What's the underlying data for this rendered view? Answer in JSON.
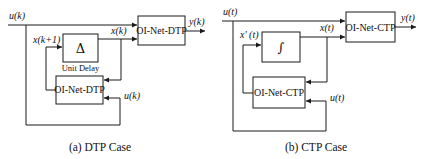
{
  "diagram_a": {
    "caption": "(a) DTP Case",
    "input_label": "u(k)",
    "output_label": "y(k)",
    "state_next_label": "x(k+1)",
    "state_label": "x(k)",
    "feedback_input_label": "u(k)",
    "delay_block": {
      "symbol": "Δ",
      "caption": "Unit Delay"
    },
    "top_block": {
      "label": "OI-Net-DTP"
    },
    "bottom_block": {
      "label": "OI-Net-DTP"
    }
  },
  "diagram_b": {
    "caption": "(b) CTP Case",
    "input_label": "u(t)",
    "output_label": "y(t)",
    "state_derivative_label": "x' (t)",
    "state_label": "x(t)",
    "feedback_input_label": "u(t)",
    "integrator_block": {
      "symbol": "∫"
    },
    "top_block": {
      "label": "OI-Net-CTP"
    },
    "bottom_block": {
      "label": "OI-Net-CTP"
    }
  }
}
